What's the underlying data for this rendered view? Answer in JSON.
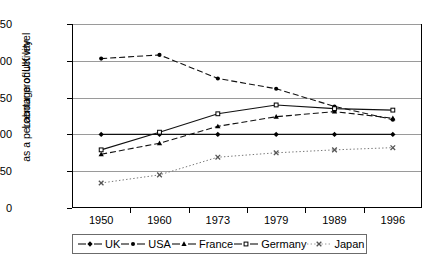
{
  "chart_data": {
    "type": "line",
    "title": "",
    "xlabel": "",
    "ylabel_line1": "Labour productivity",
    "ylabel_line2": "as a percentage of UK level",
    "categories": [
      "1950",
      "1960",
      "1973",
      "1979",
      "1989",
      "1996"
    ],
    "yticks": [
      "0",
      "50",
      "100",
      "150",
      "200",
      "250"
    ],
    "ylim": [
      0,
      250
    ],
    "grid": true,
    "legend_position": "bottom",
    "series": [
      {
        "name": "UK",
        "marker": "diamond",
        "line": "solid",
        "values": [
          100,
          100,
          100,
          100,
          100,
          100
        ]
      },
      {
        "name": "USA",
        "marker": "circle",
        "line": "dashed",
        "values": [
          203,
          208,
          176,
          162,
          138,
          120
        ]
      },
      {
        "name": "France",
        "marker": "triangle",
        "line": "dashed",
        "values": [
          73,
          88,
          111,
          124,
          131,
          122
        ]
      },
      {
        "name": "Germany",
        "marker": "square",
        "line": "solid",
        "values": [
          79,
          103,
          128,
          140,
          135,
          133
        ]
      },
      {
        "name": "Japan",
        "marker": "cross",
        "line": "dotted",
        "values": [
          34,
          45,
          69,
          75,
          79,
          82
        ]
      }
    ]
  }
}
